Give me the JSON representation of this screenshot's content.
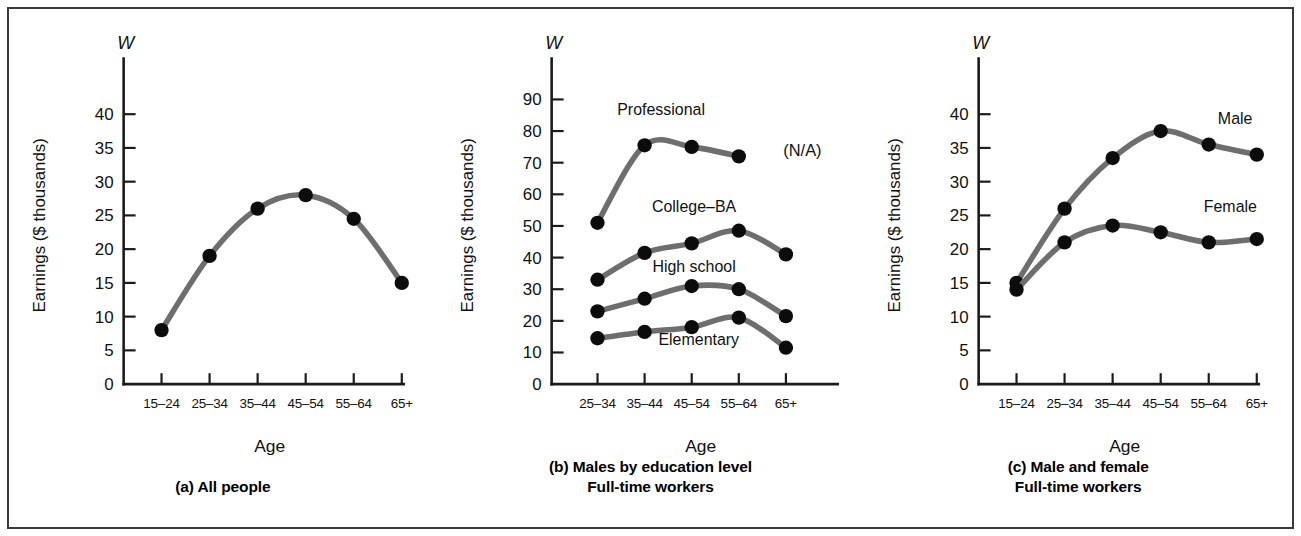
{
  "figure": {
    "background": "#ffffff",
    "border_color": "#3a3a3a",
    "line_color": "#6e6e6e",
    "marker_color": "#0c0c0c"
  },
  "panels": [
    {
      "id": "a",
      "caption_line1": "(a) All people",
      "caption_line2": "",
      "w_symbol": "W",
      "ylabel": "Earnings ($ thousands)",
      "xlabel": "Age",
      "ytick_labels": [
        "0",
        "5",
        "10",
        "15",
        "20",
        "25",
        "30",
        "35",
        "40"
      ],
      "xtick_labels": [
        "15–24",
        "25–34",
        "35–44",
        "45–54",
        "55–64",
        "65+"
      ]
    },
    {
      "id": "b",
      "caption_line1": "(b) Males by education level",
      "caption_line2": "Full-time workers",
      "w_symbol": "W",
      "ylabel": "Earnings ($ thousands)",
      "xlabel": "Age",
      "ytick_labels": [
        "0",
        "10",
        "20",
        "30",
        "40",
        "50",
        "60",
        "70",
        "80",
        "90"
      ],
      "xtick_labels": [
        "25–34",
        "35–44",
        "45–54",
        "55–64",
        "65+"
      ],
      "na_note": "(N/A)"
    },
    {
      "id": "c",
      "caption_line1": "(c) Male and female",
      "caption_line2": "Full-time workers",
      "w_symbol": "W",
      "ylabel": "Earnings ($ thousands)",
      "xlabel": "Age",
      "ytick_labels": [
        "0",
        "5",
        "10",
        "15",
        "20",
        "25",
        "30",
        "35",
        "40"
      ],
      "xtick_labels": [
        "15–24",
        "25–34",
        "35–44",
        "45–54",
        "55–64",
        "65+"
      ]
    }
  ],
  "chart_data": [
    {
      "type": "line",
      "title": "(a) All people",
      "xlabel": "Age",
      "ylabel": "Earnings ($ thousands)",
      "y_axis_symbol": "W",
      "categories": [
        "15–24",
        "25–34",
        "35–44",
        "45–54",
        "55–64",
        "65+"
      ],
      "ylim": [
        0,
        45
      ],
      "yticks": [
        0,
        5,
        10,
        15,
        20,
        25,
        30,
        35,
        40
      ],
      "grid": false,
      "legend": "none",
      "series": [
        {
          "name": "All people",
          "values": [
            8,
            19,
            26,
            28,
            24.5,
            15
          ]
        }
      ]
    },
    {
      "type": "line",
      "title": "(b) Males by education level / Full-time workers",
      "xlabel": "Age",
      "ylabel": "Earnings ($ thousands)",
      "y_axis_symbol": "W",
      "categories": [
        "25–34",
        "35–44",
        "45–54",
        "55–64",
        "65+"
      ],
      "ylim": [
        0,
        96
      ],
      "yticks": [
        0,
        10,
        20,
        30,
        40,
        50,
        60,
        70,
        80,
        90
      ],
      "grid": false,
      "legend": "inline-labels",
      "annotations": [
        "(N/A)"
      ],
      "series": [
        {
          "name": "Professional",
          "values": [
            51,
            75.5,
            75,
            72,
            null
          ]
        },
        {
          "name": "College–BA",
          "values": [
            33,
            41.5,
            44.5,
            48.5,
            41
          ]
        },
        {
          "name": "High school",
          "values": [
            23,
            27,
            31,
            30,
            21.5
          ]
        },
        {
          "name": "Elementary",
          "values": [
            14.5,
            16.5,
            18,
            21,
            11.5
          ]
        }
      ]
    },
    {
      "type": "line",
      "title": "(c) Male and female / Full-time workers",
      "xlabel": "Age",
      "ylabel": "Earnings ($ thousands)",
      "y_axis_symbol": "W",
      "categories": [
        "15–24",
        "25–34",
        "35–44",
        "45–54",
        "55–64",
        "65+"
      ],
      "ylim": [
        0,
        45
      ],
      "yticks": [
        0,
        5,
        10,
        15,
        20,
        25,
        30,
        35,
        40
      ],
      "grid": false,
      "legend": "inline-labels",
      "series": [
        {
          "name": "Male",
          "values": [
            15,
            26,
            33.5,
            37.5,
            35.5,
            34
          ]
        },
        {
          "name": "Female",
          "values": [
            14,
            21,
            23.5,
            22.5,
            21,
            21.5
          ]
        }
      ]
    }
  ]
}
